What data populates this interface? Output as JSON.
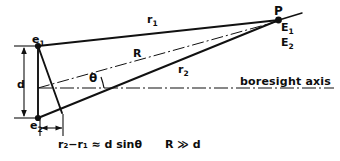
{
  "figure": {
    "background_color": "#ffffff",
    "line_color": "#111111"
  },
  "labels": {
    "element_1": "e",
    "element_1_sub": "1",
    "element_2": "e",
    "element_2_sub": "2",
    "target_point": "P",
    "field_1": "E",
    "field_1_sub": "1",
    "field_2": "E",
    "field_2_sub": "2",
    "range_1": "r",
    "range_1_sub": "1",
    "range_mean": "R",
    "range_2": "r",
    "range_2_sub": "2",
    "baseline": "d",
    "angle": "θ",
    "axis_label": "boresight axis"
  },
  "equations": {
    "path_difference": "r₂−r₁ ≈ d sinθ",
    "far_field_condition": "R ≫ d"
  },
  "geometry": {
    "e1": [
      38,
      46
    ],
    "e2": [
      38,
      118
    ],
    "P": [
      278,
      20
    ],
    "boresight_y": 88,
    "theta_deg": 9
  }
}
